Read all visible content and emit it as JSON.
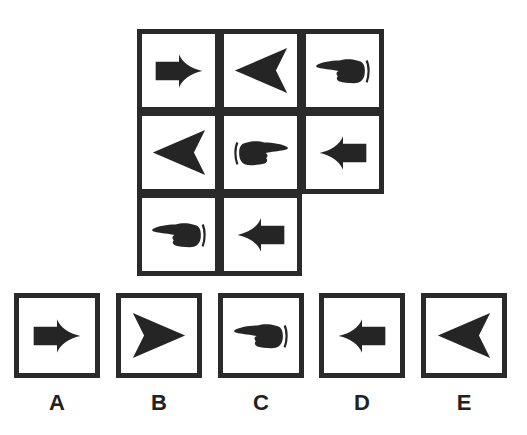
{
  "puzzle": {
    "type": "matrix-reasoning",
    "rows": 3,
    "cols": 3,
    "cells": [
      {
        "row": 0,
        "col": 0,
        "symbol": "block-arrow-right-icon"
      },
      {
        "row": 0,
        "col": 1,
        "symbol": "arrowhead-left-icon"
      },
      {
        "row": 0,
        "col": 2,
        "symbol": "pointing-hand-left-icon"
      },
      {
        "row": 1,
        "col": 0,
        "symbol": "arrowhead-left-icon"
      },
      {
        "row": 1,
        "col": 1,
        "symbol": "pointing-hand-right-icon"
      },
      {
        "row": 1,
        "col": 2,
        "symbol": "block-arrow-left-icon"
      },
      {
        "row": 2,
        "col": 0,
        "symbol": "pointing-hand-left-icon"
      },
      {
        "row": 2,
        "col": 1,
        "symbol": "block-arrow-left-icon"
      },
      {
        "row": 2,
        "col": 2,
        "symbol": "missing"
      }
    ]
  },
  "options": [
    {
      "label": "A",
      "symbol": "block-arrow-right-icon"
    },
    {
      "label": "B",
      "symbol": "arrowhead-right-icon"
    },
    {
      "label": "C",
      "symbol": "pointing-hand-left-icon"
    },
    {
      "label": "D",
      "symbol": "block-arrow-left-icon"
    },
    {
      "label": "E",
      "symbol": "arrowhead-left-icon"
    }
  ],
  "colors": {
    "ink": "#252525",
    "border": "#2a2a2a",
    "background": "#ffffff"
  }
}
